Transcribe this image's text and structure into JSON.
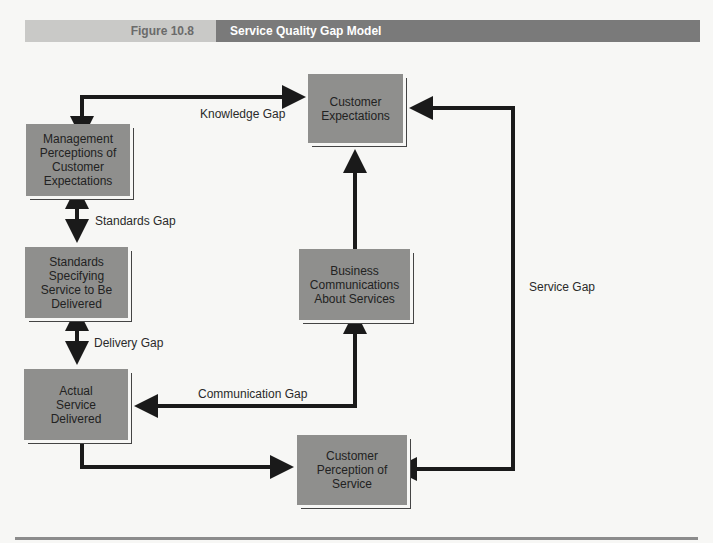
{
  "header": {
    "figure_number": "Figure 10.8",
    "title": "Service Quality Gap Model"
  },
  "boxes": {
    "customer_expectations": "Customer\nExpectations",
    "management_perceptions": "Management\nPerceptions of\nCustomer\nExpectations",
    "standards": "Standards\nSpecifying\nService to Be\nDelivered",
    "actual_service": "Actual\nService\nDelivered",
    "business_communications": "Business\nCommunications\nAbout Services",
    "customer_perception": "Customer\nPerception of\nService"
  },
  "gaps": {
    "knowledge": "Knowledge Gap",
    "standards": "Standards Gap",
    "delivery": "Delivery Gap",
    "communication": "Communication Gap",
    "service": "Service Gap"
  },
  "colors": {
    "box_fill": "#8f8f8d",
    "header_light": "#c9c9c7",
    "header_dark": "#7a7a7a",
    "arrow": "#1a1a1a"
  }
}
